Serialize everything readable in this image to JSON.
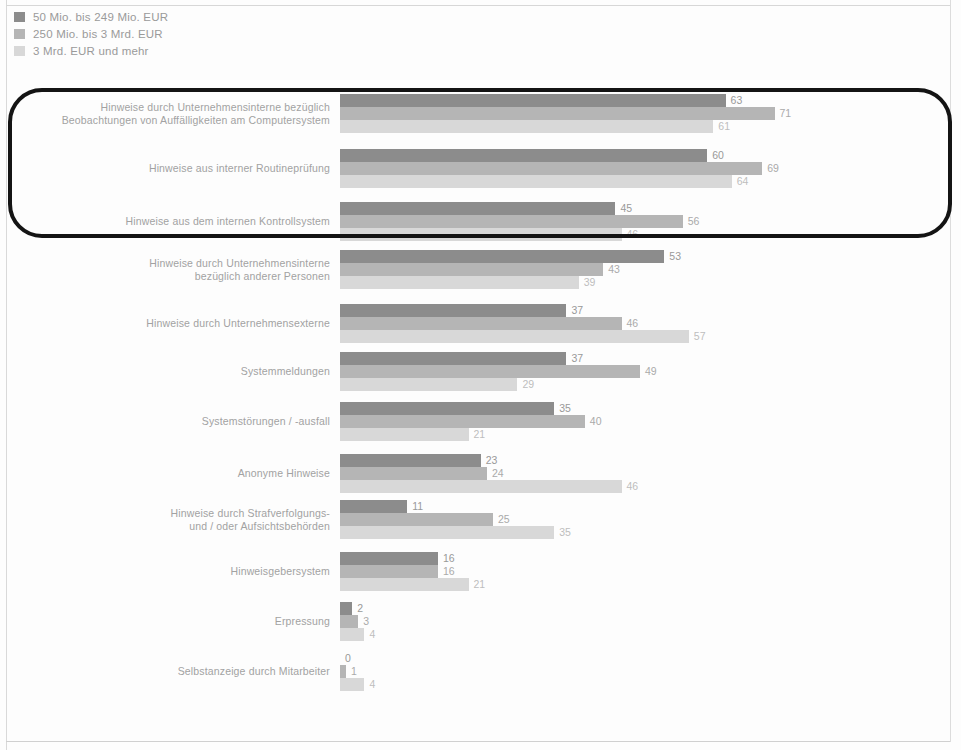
{
  "legend": {
    "items": [
      {
        "label": "50 Mio. bis 249 Mio. EUR",
        "color": "#8c8c8c"
      },
      {
        "label": "250 Mio. bis 3 Mrd. EUR",
        "color": "#b5b5b5"
      },
      {
        "label": "3 Mrd. EUR und mehr",
        "color": "#d8d8d8"
      }
    ]
  },
  "axis": {
    "title": "Umsatz in Prozent",
    "ticks": [
      "0",
      "10",
      "20",
      "30",
      "40",
      "50",
      "60",
      "70",
      "80",
      "90",
      "100"
    ]
  },
  "annotation": {
    "name": "highlight-rounded-rectangle"
  },
  "chart_data": {
    "type": "bar",
    "orientation": "horizontal",
    "title": "",
    "xlabel": "Umsatz in Prozent",
    "ylabel": "",
    "xlim": [
      0,
      100
    ],
    "grid": false,
    "legend_position": "top-left",
    "categories": [
      "Hinweise durch Unternehmensinterne bezüglich Beobachtungen von Auffälligkeiten am Computersystem",
      "Hinweise aus interner Routineprüfung",
      "Hinweise aus dem internen Kontrollsystem",
      "Hinweise durch Unternehmensinterne bezüglich anderer Personen",
      "Hinweise durch Unternehmensexterne",
      "Systemmeldungen",
      "Systemstörungen / -ausfall",
      "Anonyme Hinweise",
      "Hinweise durch Strafverfolgungs- und / oder Aufsichtsbehörden",
      "Hinweisgebersystem",
      "Erpressung",
      "Selbstanzeige durch Mitarbeiter"
    ],
    "category_lines": [
      [
        "Hinweise durch Unternehmensinterne bezüglich",
        "Beobachtungen von Auffälligkeiten am Computersystem"
      ],
      [
        "Hinweise aus interner Routineprüfung"
      ],
      [
        "Hinweise aus dem internen Kontrollsystem"
      ],
      [
        "Hinweise durch Unternehmensinterne",
        "bezüglich anderer Personen"
      ],
      [
        "Hinweise durch Unternehmensexterne"
      ],
      [
        "Systemmeldungen"
      ],
      [
        "Systemstörungen / -ausfall"
      ],
      [
        "Anonyme Hinweise"
      ],
      [
        "Hinweise durch Strafverfolgungs-",
        "und / oder Aufsichtsbehörden"
      ],
      [
        "Hinweisgebersystem"
      ],
      [
        "Erpressung"
      ],
      [
        "Selbstanzeige durch Mitarbeiter"
      ]
    ],
    "series": [
      {
        "name": "50 Mio. bis 249 Mio. EUR",
        "color": "#8c8c8c",
        "values": [
          63,
          60,
          45,
          53,
          37,
          37,
          35,
          23,
          11,
          16,
          2,
          0
        ]
      },
      {
        "name": "250 Mio. bis 3 Mrd. EUR",
        "color": "#b5b5b5",
        "values": [
          71,
          69,
          56,
          43,
          46,
          49,
          40,
          24,
          25,
          16,
          3,
          1
        ]
      },
      {
        "name": "3 Mrd. EUR und mehr",
        "color": "#d8d8d8",
        "values": [
          61,
          64,
          46,
          39,
          57,
          29,
          21,
          46,
          35,
          21,
          4,
          4
        ]
      }
    ]
  }
}
